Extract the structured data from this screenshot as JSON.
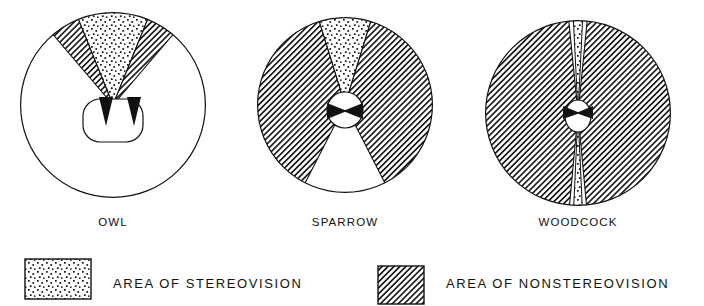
{
  "figure": {
    "title_present": false,
    "background_color": "#ffffff",
    "ink_color": "#111111",
    "width": 704,
    "height": 306
  },
  "diagrams": [
    {
      "id": "owl",
      "label": "OWL",
      "center_x": 113,
      "center_y": 105,
      "radius": 93,
      "label_x": 113,
      "label_y": 226,
      "field_note": "wide frontal stereovision cone, small monocular side wedges, large blind rear field",
      "stereo_half_angle_deg": 35,
      "nonstereo_half_angle_deg": 47,
      "head": {
        "type": "rounded-rect",
        "cx": 113,
        "cy": 120,
        "rx": 30,
        "ry": 22
      },
      "eyes": [
        {
          "side": "left",
          "x": 99,
          "y": 104
        },
        {
          "side": "right",
          "x": 127,
          "y": 104
        }
      ]
    },
    {
      "id": "sparrow",
      "label": "SPARROW",
      "center_x": 345,
      "center_y": 105,
      "radius": 88,
      "label_x": 345,
      "label_y": 226,
      "field_note": "narrow frontal stereovision cone, very large lateral nonstereo fields, wide blind rear sector",
      "stereo_half_angle_deg": 17,
      "nonstereo_half_angle_deg": 64,
      "head": {
        "type": "circle",
        "cx": 345,
        "cy": 110,
        "rx": 18,
        "ry": 18
      },
      "eyes": [
        {
          "side": "left",
          "x": 329,
          "y": 110
        },
        {
          "side": "right",
          "x": 361,
          "y": 110
        }
      ]
    },
    {
      "id": "woodcock",
      "label": "WOODCOCK",
      "center_x": 578,
      "center_y": 113,
      "radius": 93,
      "label_x": 578,
      "label_y": 226,
      "field_note": "near total panoramic nonstereo field with slender stereovision slivers both in front and behind",
      "stereo_half_angle_deg": 6,
      "nonstereo_half_angle_deg": 84,
      "head": {
        "type": "ellipse",
        "cx": 578,
        "cy": 115,
        "rx": 13,
        "ry": 16
      },
      "eyes": [
        {
          "side": "left",
          "x": 566,
          "y": 112
        },
        {
          "side": "right",
          "x": 590,
          "y": 112
        }
      ]
    }
  ],
  "legend": {
    "items": [
      {
        "id": "stereovision",
        "pattern": "stipple",
        "label": "AREA OF STEREOVISION",
        "swatch_x": 25,
        "swatch_y": 259,
        "swatch_w": 66,
        "swatch_h": 40,
        "text_x": 113,
        "text_y": 288
      },
      {
        "id": "nonstereovision",
        "pattern": "hatch",
        "label": "AREA OF NONSTEREOVISION",
        "swatch_x": 378,
        "swatch_y": 266,
        "swatch_w": 46,
        "swatch_h": 38,
        "text_x": 446,
        "text_y": 288
      }
    ]
  }
}
